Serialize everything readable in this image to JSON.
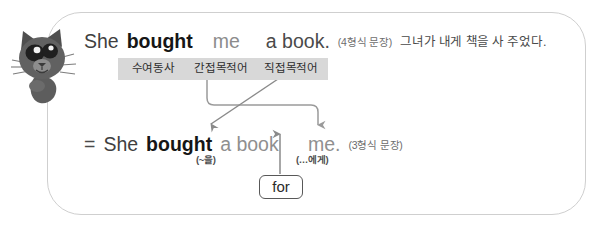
{
  "panel": {
    "mascot": "cat-mascot"
  },
  "sentence_top": {
    "word_subject": "She",
    "word_verb": "bought",
    "word_indirect_object": "me",
    "word_direct_object": "a book.",
    "pattern_note": "(4형식 문장)",
    "translation": "그녀가 내게 책을 사 주었다."
  },
  "tags": {
    "verb": "수여동사",
    "indirect_object": "간접목적어",
    "direct_object": "직접목적어"
  },
  "sentence_bottom": {
    "equals": "=",
    "word_subject": "She",
    "word_verb": "bought",
    "word_direct_object": "a book",
    "word_indirect_object": "me.",
    "pattern_note": "(3형식 문장)",
    "note_direct_object": "(~을)",
    "note_indirect_object": "(…에게)"
  },
  "preposition_box": {
    "label": "for"
  },
  "colors": {
    "panel_border": "#cfcfcf",
    "tag_background": "#d8d8d8",
    "connector": "#9a9a9a",
    "text_dark": "#161616",
    "text_gray": "#8f8f8f",
    "cat_body": "#5a5a5a"
  }
}
